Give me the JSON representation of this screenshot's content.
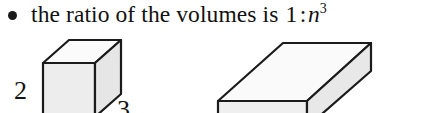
{
  "page": {
    "width": 431,
    "height": 113,
    "background": "#ffffff"
  },
  "bullet_item": {
    "marker": "bullet-dot",
    "text": "the ratio of the volumes is",
    "formula": {
      "left_term": "1",
      "separator": ":",
      "right_base": "n",
      "right_exponent": "3",
      "plain": "1 : n³"
    }
  },
  "figures": {
    "small_box": {
      "name": "small-cuboid",
      "labels": {
        "height": "2",
        "depth": "3"
      },
      "colors": {
        "top_face": "#fbfbfb",
        "front_face": "#ededed",
        "right_face": "#e6e6e6",
        "edge": "#1b1b1b"
      }
    },
    "large_box": {
      "name": "large-cuboid",
      "labels": {},
      "colors": {
        "top_face": "#fafafa",
        "front_face": "#efefef",
        "right_face": "#e8e8e8",
        "edge": "#1b1b1b"
      }
    }
  }
}
